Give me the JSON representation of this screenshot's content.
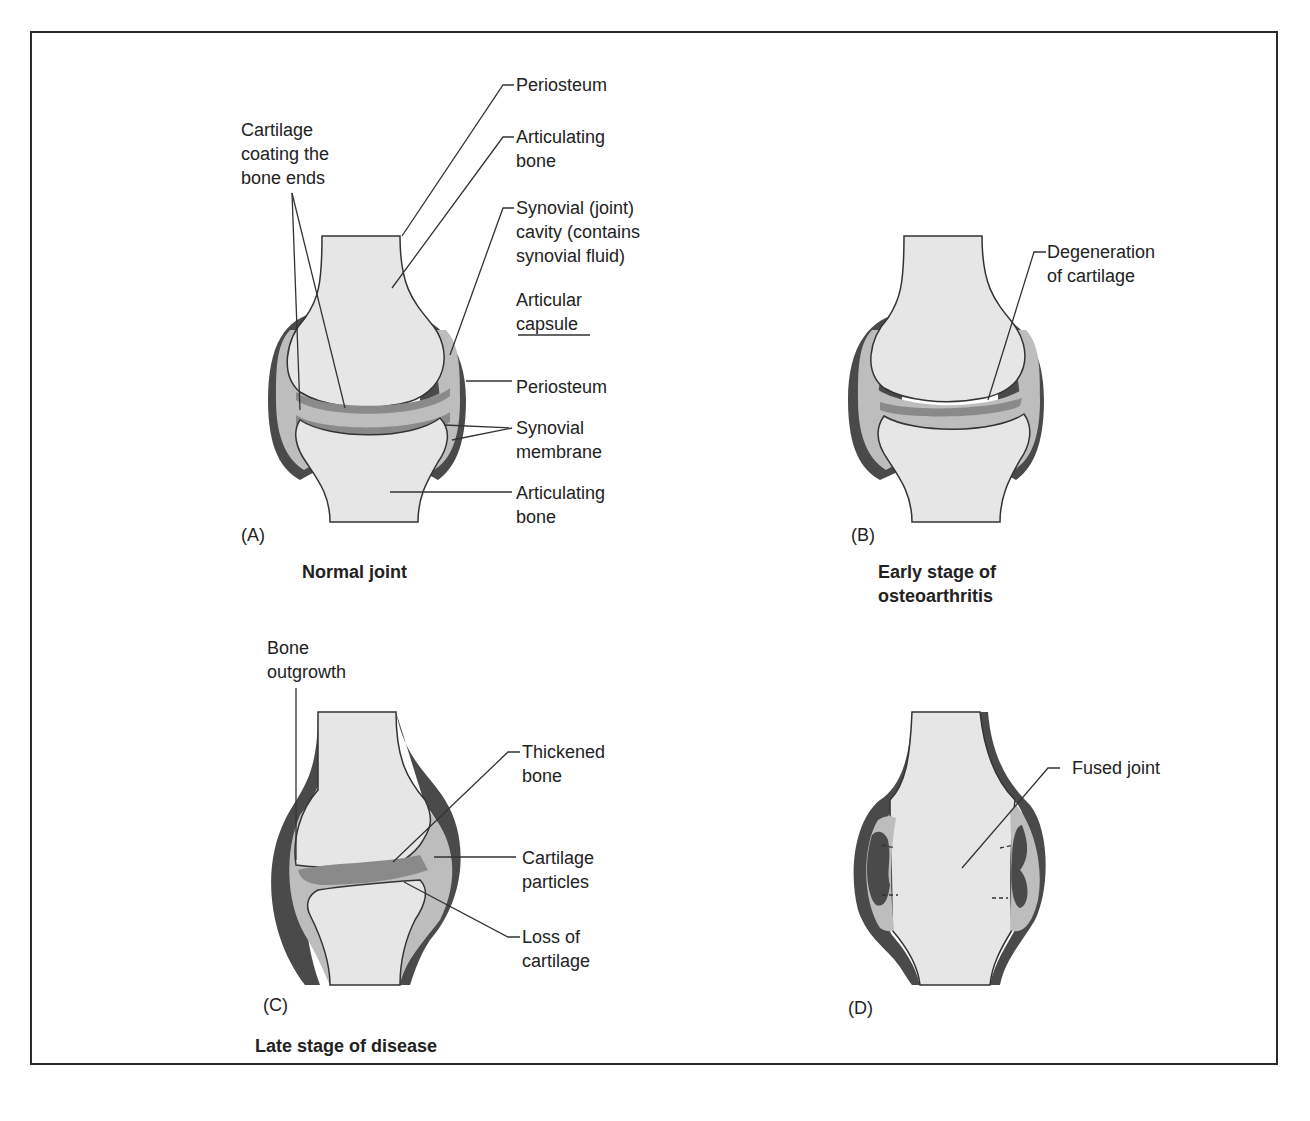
{
  "figure": {
    "panels": [
      {
        "id": "A",
        "letter": "(A)",
        "caption": "Normal joint",
        "labels": {
          "cartilage_1": "Cartilage",
          "cartilage_2": "coating the",
          "cartilage_3": "bone ends",
          "periosteum_top": "Periosteum",
          "articulating_bone_top_1": "Articulating",
          "articulating_bone_top_2": "bone",
          "synovial_cavity_1": "Synovial (joint)",
          "synovial_cavity_2": "cavity (contains",
          "synovial_cavity_3": "synovial fluid)",
          "articular_capsule_1": "Articular",
          "articular_capsule_2": "capsule",
          "periosteum_mid": "Periosteum",
          "synovial_membrane_1": "Synovial",
          "synovial_membrane_2": "membrane",
          "articulating_bone_bottom_1": "Articulating",
          "articulating_bone_bottom_2": "bone"
        }
      },
      {
        "id": "B",
        "letter": "(B)",
        "caption_1": "Early stage of",
        "caption_2": "osteoarthritis",
        "labels": {
          "degeneration_1": "Degeneration",
          "degeneration_2": "of cartilage"
        }
      },
      {
        "id": "C",
        "letter": "(C)",
        "caption": "Late stage of disease",
        "labels": {
          "bone_outgrowth_1": "Bone",
          "bone_outgrowth_2": "outgrowth",
          "thickened_bone_1": "Thickened",
          "thickened_bone_2": "bone",
          "cartilage_particles_1": "Cartilage",
          "cartilage_particles_2": "particles",
          "loss_of_cartilage_1": "Loss of",
          "loss_of_cartilage_2": "cartilage"
        }
      },
      {
        "id": "D",
        "letter": "(D)",
        "labels": {
          "fused_joint": "Fused joint"
        }
      }
    ],
    "colors": {
      "bone": "#e6e6e6",
      "capsule_dark": "#4a4a4a",
      "synovial_fluid": "#bdbdbd",
      "cartilage": "#8a8a8a",
      "frame": "#2a2a2a",
      "line": "#333333"
    }
  }
}
